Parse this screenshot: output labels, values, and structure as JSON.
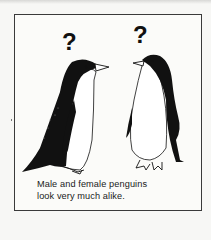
{
  "illustration": {
    "subjects": [
      "penguin-left",
      "penguin-right"
    ],
    "marks": [
      "?",
      "?"
    ],
    "colors": {
      "ink": "#111111",
      "paper": "#fbfbf9",
      "border": "#3a3a3a"
    }
  },
  "caption": {
    "line1": "Male and female penguins",
    "line2": "look very much alike."
  }
}
